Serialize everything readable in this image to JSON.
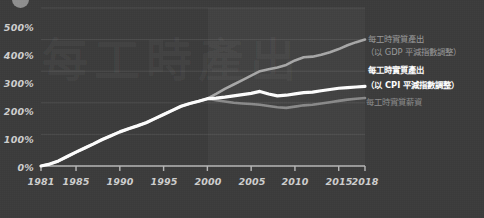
{
  "chart_data": {
    "type": "line",
    "title": "",
    "xlabel": "",
    "ylabel": "",
    "xlim": [
      1981,
      2018
    ],
    "ylim": [
      0,
      500
    ],
    "grid": true,
    "legend_position": "right-inline",
    "y_ticks": [
      "0%",
      "100%",
      "200%",
      "300%",
      "400%",
      "500%"
    ],
    "y_tick_values": [
      0,
      100,
      200,
      300,
      400,
      500
    ],
    "x_ticks": [
      "1981",
      "1985",
      "1990",
      "1995",
      "2000",
      "2005",
      "2010",
      "2015",
      "2018"
    ],
    "x_tick_values": [
      1981,
      1985,
      1990,
      1995,
      2000,
      2005,
      2010,
      2015,
      2018
    ],
    "shaded_region": {
      "from": 2000,
      "to": 2018,
      "color": "#4a4a4a"
    },
    "series": [
      {
        "name": "每工時實質產出（以 GDP 平減指數調整）",
        "color": "#a8a8a8",
        "x": [
          1981,
          1982,
          1983,
          1984,
          1985,
          1986,
          1987,
          1988,
          1989,
          1990,
          1991,
          1992,
          1993,
          1994,
          1995,
          1996,
          1997,
          1998,
          1999,
          2000,
          2001,
          2002,
          2003,
          2004,
          2005,
          2006,
          2007,
          2008,
          2009,
          2010,
          2011,
          2012,
          2013,
          2014,
          2015,
          2016,
          2017,
          2018
        ],
        "values": [
          0,
          6,
          16,
          30,
          44,
          57,
          70,
          84,
          96,
          108,
          118,
          127,
          137,
          150,
          163,
          176,
          189,
          198,
          205,
          213,
          228,
          244,
          258,
          272,
          286,
          300,
          306,
          312,
          320,
          334,
          344,
          346,
          352,
          360,
          370,
          382,
          392,
          400
        ]
      },
      {
        "name": "每工時實質產出（以 CPI 平減指數調整）",
        "color": "#ffffff",
        "x": [
          1981,
          1982,
          1983,
          1984,
          1985,
          1986,
          1987,
          1988,
          1989,
          1990,
          1991,
          1992,
          1993,
          1994,
          1995,
          1996,
          1997,
          1998,
          1999,
          2000,
          2001,
          2002,
          2003,
          2004,
          2005,
          2006,
          2007,
          2008,
          2009,
          2010,
          2011,
          2012,
          2013,
          2014,
          2015,
          2016,
          2017,
          2018
        ],
        "values": [
          0,
          6,
          16,
          30,
          44,
          57,
          70,
          84,
          96,
          108,
          118,
          127,
          137,
          150,
          163,
          176,
          189,
          198,
          205,
          213,
          215,
          218,
          222,
          226,
          230,
          236,
          228,
          222,
          224,
          228,
          232,
          234,
          238,
          242,
          246,
          248,
          250,
          252
        ]
      },
      {
        "name": "每工時實質薪資",
        "color": "#8a8a8a",
        "x": [
          1981,
          1982,
          1983,
          1984,
          1985,
          1986,
          1987,
          1988,
          1989,
          1990,
          1991,
          1992,
          1993,
          1994,
          1995,
          1996,
          1997,
          1998,
          1999,
          2000,
          2001,
          2002,
          2003,
          2004,
          2005,
          2006,
          2007,
          2008,
          2009,
          2010,
          2011,
          2012,
          2013,
          2014,
          2015,
          2016,
          2017,
          2018
        ],
        "values": [
          0,
          6,
          16,
          30,
          44,
          57,
          70,
          84,
          96,
          108,
          118,
          127,
          137,
          150,
          163,
          176,
          189,
          198,
          205,
          213,
          208,
          204,
          200,
          198,
          196,
          194,
          190,
          186,
          184,
          188,
          192,
          194,
          198,
          202,
          206,
          210,
          213,
          215
        ]
      }
    ]
  },
  "axis": {
    "y_labels": [
      "500%",
      "400%",
      "300%",
      "200%",
      "100%",
      "0%"
    ],
    "x_labels": [
      "1981",
      "1985",
      "1990",
      "1995",
      "2000",
      "2005",
      "2010",
      "2015",
      "2018"
    ]
  },
  "annotations": {
    "gdp_line1": "每工時實質產出",
    "gdp_line2": "（以 GDP 平減指數調整）",
    "cpi_line1": "每工時實質產出",
    "cpi_line2": "（以 CPI 平減指數調整）",
    "wage_line1": "每工時實質薪資"
  },
  "watermark": {
    "text": "每工時產出"
  },
  "colors": {
    "background": "#3b3b3b",
    "shade": "#4a4a4a",
    "axis": "#b8b8b8",
    "gdp_series": "#a8a8a8",
    "cpi_series": "#ffffff",
    "wage_series": "#8a8a8a",
    "tick_text": "#cfcfcf"
  }
}
